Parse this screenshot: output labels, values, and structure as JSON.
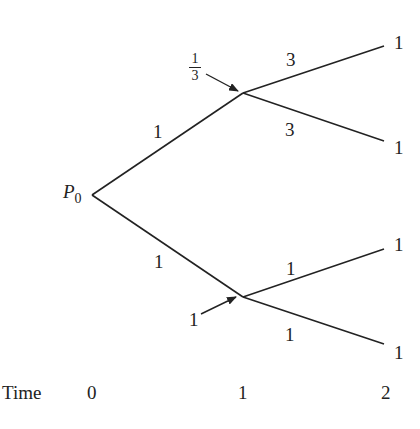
{
  "diagram": {
    "type": "binomial-tree",
    "colors": {
      "line": "#222222",
      "text": "#222222",
      "background": "#ffffff"
    },
    "root": {
      "label": "P",
      "subscript": "0"
    },
    "branches_t0_t1": {
      "upper_weight": "1",
      "lower_weight": "1"
    },
    "node_annotations": {
      "upper_node": {
        "numerator": "1",
        "denominator": "3"
      },
      "lower_node": "1"
    },
    "branches_t1_t2": {
      "upper_up_weight": "3",
      "upper_down_weight": "3",
      "lower_up_weight": "1",
      "lower_down_weight": "1"
    },
    "terminal_values": [
      "1",
      "1",
      "1",
      "1"
    ],
    "time_axis": {
      "label": "Time",
      "ticks": [
        "0",
        "1",
        "2"
      ]
    }
  }
}
